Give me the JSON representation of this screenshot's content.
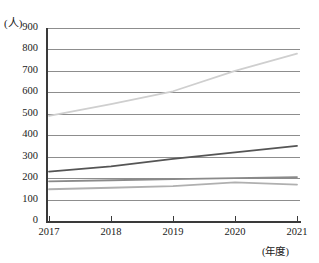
{
  "header": {
    "clipped_text_left": "",
    "clipped_text_right": ""
  },
  "axes": {
    "y_unit": "(人)",
    "x_unit": "(年度)",
    "y_ticks": [
      "900",
      "800",
      "700",
      "600",
      "500",
      "400",
      "300",
      "200",
      "100",
      "0"
    ],
    "x_ticks": [
      "2017",
      "2018",
      "2019",
      "2020",
      "2021"
    ]
  },
  "colors": {
    "series_1": "#cfcfcf",
    "series_2": "#555555",
    "series_3": "#8a8a8a",
    "series_4": "#b0b0b0",
    "grid": "#8d8d8d",
    "axis": "#3a3a3a",
    "background": "#ffffff"
  },
  "chart_data": {
    "type": "line",
    "title": "",
    "xlabel": "(年度)",
    "ylabel": "(人)",
    "x": [
      "2017",
      "2018",
      "2019",
      "2020",
      "2021"
    ],
    "ylim": [
      0,
      900
    ],
    "ytick_step": 100,
    "grid": true,
    "legend": "none",
    "series": [
      {
        "name": "series-1",
        "color": "#cfcfcf",
        "values": [
          490,
          545,
          605,
          700,
          780
        ]
      },
      {
        "name": "series-2",
        "color": "#555555",
        "values": [
          230,
          255,
          290,
          320,
          350
        ]
      },
      {
        "name": "series-3",
        "color": "#8a8a8a",
        "values": [
          185,
          190,
          195,
          200,
          205
        ]
      },
      {
        "name": "series-4",
        "color": "#b0b0b0",
        "values": [
          148,
          155,
          163,
          180,
          170
        ]
      }
    ]
  }
}
